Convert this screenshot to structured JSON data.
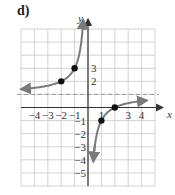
{
  "panel": {
    "label": "d)"
  },
  "chart_data": {
    "type": "line",
    "title": "d)",
    "xlabel": "x",
    "ylabel": "y",
    "xlim": [
      -5,
      5
    ],
    "ylim": [
      -6,
      6
    ],
    "grid": true,
    "x_tick_labels": [
      "-4",
      "-3",
      "-2",
      "-1",
      "1",
      "3",
      "4"
    ],
    "y_tick_labels": [
      "3",
      "2",
      "-1",
      "-2",
      "-3",
      "-4",
      "-5"
    ],
    "function": "y = 1 - 2/x",
    "asymptotes": {
      "vertical": 0,
      "horizontal": 1,
      "horizontal_style": "dashed"
    },
    "series": [
      {
        "name": "left-branch",
        "x_range": [
          -5,
          -0.35
        ],
        "points_marked": [
          [
            -2,
            2
          ],
          [
            -1,
            3
          ]
        ]
      },
      {
        "name": "right-branch",
        "x_range": [
          0.39,
          4.4
        ],
        "points_marked": [
          [
            1,
            -1
          ],
          [
            2,
            0
          ]
        ]
      }
    ],
    "colors": {
      "curve": "#7a7a7a",
      "grid": "#c8c8c8",
      "axis": "#333333",
      "asymptote": "#999999",
      "points": "#111111"
    }
  }
}
